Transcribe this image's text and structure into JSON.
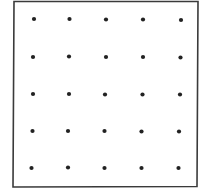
{
  "diagram": {
    "type": "dot-grid",
    "rows": 5,
    "cols": 5,
    "border_color": "#3a3a3a",
    "dot_color": "#222222",
    "frame": {
      "tl": [
        14,
        1.5
      ],
      "tr": [
        198,
        1.5
      ],
      "br": [
        197,
        186.5
      ],
      "bl": [
        13,
        187
      ]
    },
    "dot_rows": [
      [
        [
          34,
          19
        ],
        [
          69.5,
          19
        ],
        [
          106,
          19.5
        ],
        [
          143,
          19.5
        ],
        [
          181,
          20
        ]
      ],
      [
        [
          33,
          57
        ],
        [
          69,
          56.5
        ],
        [
          106,
          57
        ],
        [
          143,
          57
        ],
        [
          180.5,
          57.5
        ]
      ],
      [
        [
          33,
          94
        ],
        [
          69,
          94
        ],
        [
          105,
          94.5
        ],
        [
          142.5,
          94.5
        ],
        [
          180,
          94.5
        ]
      ],
      [
        [
          32.5,
          131
        ],
        [
          68,
          131
        ],
        [
          104.5,
          131
        ],
        [
          141.5,
          131.5
        ],
        [
          179,
          131.5
        ]
      ],
      [
        [
          31.5,
          168
        ],
        [
          68,
          167.5
        ],
        [
          104.5,
          168
        ],
        [
          141.5,
          168
        ],
        [
          178.5,
          168
        ]
      ]
    ]
  }
}
